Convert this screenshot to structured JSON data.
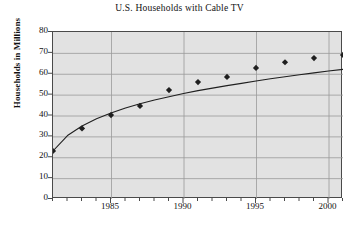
{
  "chart_data": {
    "type": "scatter",
    "title": "U.S. Households with Cable TV",
    "xlabel": "",
    "ylabel": "Households in Millions",
    "xlim": [
      1981,
      2001
    ],
    "ylim": [
      0,
      80
    ],
    "grid": true,
    "legend": "none",
    "marker": "diamond",
    "x_tick_labels": [
      "1985",
      "1990",
      "1995",
      "2000"
    ],
    "x_tick_values": [
      1985,
      1990,
      1995,
      2000
    ],
    "x_minor_tick_step": 1,
    "y_tick_labels": [
      "0",
      "10",
      "20",
      "30",
      "40",
      "50",
      "60",
      "70",
      "80"
    ],
    "y_tick_values": [
      0,
      10,
      20,
      30,
      40,
      50,
      60,
      70,
      80
    ],
    "x": [
      1981,
      1983,
      1985,
      1987,
      1989,
      1991,
      1993,
      1995,
      1997,
      1999,
      2001
    ],
    "values": [
      23,
      33.8,
      40.2,
      44.6,
      52.2,
      56,
      58.5,
      62.8,
      65.5,
      67.5,
      69
    ],
    "series": [
      {
        "name": "Households with cable TV",
        "x": [
          1981,
          1983,
          1985,
          1987,
          1989,
          1991,
          1993,
          1995,
          1997,
          1999,
          2001
        ],
        "values": [
          23,
          33.8,
          40.2,
          44.6,
          52.2,
          56,
          58.5,
          62.8,
          65.5,
          67.5,
          69
        ]
      },
      {
        "name": "fitted logarithmic trend curve",
        "type": "line",
        "x": [
          1981,
          1982,
          1983,
          1984,
          1985,
          1986,
          1987,
          1988,
          1989,
          1990,
          1991,
          1992,
          1993,
          1994,
          1995,
          1996,
          1997,
          1998,
          1999,
          2000,
          2001
        ],
        "values": [
          23,
          30.4,
          35.0,
          38.4,
          41.2,
          43.6,
          45.6,
          47.4,
          49.0,
          50.5,
          51.9,
          53.1,
          54.3,
          55.4,
          56.5,
          57.6,
          58.6,
          59.5,
          60.4,
          61.3,
          62.1
        ]
      }
    ],
    "colors": {
      "plot_background": "#e2e2e2",
      "grid": "#9a9a9a",
      "axis": "#4a4a4a",
      "marker": "#1f1f1f",
      "curve": "#1f1f1f",
      "page_background": "#ffffff"
    }
  }
}
